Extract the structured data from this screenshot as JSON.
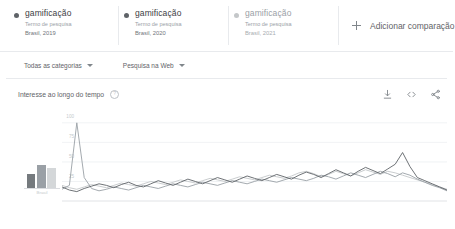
{
  "comparison": {
    "terms": [
      {
        "title": "gamificação",
        "subtitle": "Termo de pesquisa",
        "meta": "Brasil, 2019",
        "dot_color": "#5f6368",
        "muted": false
      },
      {
        "title": "gamificação",
        "subtitle": "Termo de pesquisa",
        "meta": "Brasil, 2020",
        "dot_color": "#5f6368",
        "muted": false
      },
      {
        "title": "gamificação",
        "subtitle": "Termo de pesquisa",
        "meta": "Brasil, 2021",
        "dot_color": "#c4c7c9",
        "muted": true
      }
    ],
    "add_label": "Adicionar comparação"
  },
  "filters": {
    "category": "Todas as categorias",
    "search_type": "Pesquisa na Web"
  },
  "section": {
    "title": "Interesse ao longo do tempo",
    "help": "?",
    "actions": {
      "download": "download-icon",
      "embed": "embed-icon",
      "share": "share-icon"
    }
  },
  "chart_data": {
    "type": "line",
    "title": "Interesse ao longo do tempo",
    "xlabel": "",
    "ylabel": "",
    "ylim": [
      0,
      110
    ],
    "yticks": [
      100,
      75,
      50,
      25
    ],
    "grid": true,
    "legend": "top-cards",
    "x_count": 53,
    "series": [
      {
        "name": "Brasil, 2019",
        "color": "#5f6368",
        "values": [
          18,
          14,
          12,
          16,
          19,
          22,
          20,
          17,
          21,
          24,
          20,
          18,
          22,
          26,
          23,
          20,
          24,
          28,
          25,
          22,
          26,
          30,
          27,
          24,
          28,
          32,
          29,
          26,
          30,
          34,
          31,
          28,
          33,
          37,
          34,
          30,
          35,
          40,
          36,
          32,
          38,
          43,
          39,
          35,
          41,
          47,
          62,
          44,
          30,
          26,
          22,
          18,
          14
        ]
      },
      {
        "name": "Brasil, 2020",
        "color": "#9aa0a6",
        "values": [
          15,
          20,
          100,
          30,
          16,
          13,
          15,
          18,
          16,
          14,
          17,
          20,
          18,
          16,
          19,
          22,
          20,
          18,
          21,
          24,
          22,
          20,
          23,
          26,
          24,
          22,
          25,
          28,
          26,
          24,
          27,
          30,
          28,
          26,
          29,
          33,
          31,
          28,
          32,
          36,
          33,
          30,
          34,
          38,
          35,
          31,
          36,
          33,
          28,
          24,
          20,
          17,
          13
        ]
      },
      {
        "name": "Brasil, 2021",
        "color": "#c4c7c9",
        "values": [
          20,
          17,
          15,
          18,
          21,
          19,
          17,
          20,
          23,
          21,
          19,
          22,
          25,
          23,
          21,
          24,
          27,
          25,
          23,
          26,
          29,
          27,
          25,
          28,
          31,
          29,
          27,
          30,
          33,
          31,
          29,
          32,
          36,
          38,
          35,
          31,
          34,
          38,
          35,
          32,
          36,
          40,
          37,
          34,
          38,
          36,
          33,
          30,
          27,
          24,
          21,
          18,
          15
        ]
      }
    ]
  },
  "thumbnail": {
    "type": "bar",
    "bars": [
      {
        "value": 0.55,
        "color": "#757a7e"
      },
      {
        "value": 0.92,
        "color": "#9aa0a6"
      },
      {
        "value": 0.78,
        "color": "#d4d7d9"
      }
    ],
    "caption": "Brasil"
  }
}
